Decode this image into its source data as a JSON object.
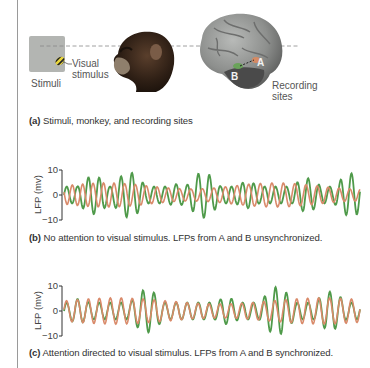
{
  "figure": {
    "panel_a": {
      "stimuli_label": "Stimuli",
      "visual_stimulus_label_line1": "Visual",
      "visual_stimulus_label_line2": "stimulus",
      "recording_sites_line1": "Recording",
      "recording_sites_line2": "sites",
      "site_a": "A",
      "site_b": "B",
      "caption_letter": "(a)",
      "caption_text": " Stimuli, monkey, and recording sites"
    },
    "panel_b": {
      "caption_letter": "(b)",
      "caption_text": " No attention to visual stimulus. LFPs from A and B unsynchronized."
    },
    "panel_c": {
      "caption_letter": "(c)",
      "caption_text": " Attention directed to visual stimulus. LFPs from A and B synchronized."
    },
    "axis": {
      "ylabel": "LFP (mv)",
      "ticks": [
        "10",
        "0",
        "−10"
      ]
    },
    "colors": {
      "site_a_trace": "#d98a6a",
      "site_b_trace": "#4f9a4a",
      "stimulus_gray": "#b3b5b2"
    }
  },
  "chart_data": [
    {
      "type": "line",
      "title": "(b) No attention to visual stimulus. LFPs from A and B unsynchronized.",
      "xlabel": "",
      "ylabel": "LFP (mv)",
      "ylim": [
        -10,
        10
      ],
      "yticks": [
        10,
        0,
        -10
      ],
      "grid": false,
      "series": [
        {
          "name": "Site B (green)",
          "color": "#4f9a4a",
          "description": "oscillation with bursts reaching about +10/-10 mV, out of phase with site A"
        },
        {
          "name": "Site A (orange)",
          "color": "#d98a6a",
          "description": "smaller oscillation about +/-4 mV, not phase locked to site B"
        }
      ]
    },
    {
      "type": "line",
      "title": "(c) Attention directed to visual stimulus. LFPs from A and B synchronized.",
      "xlabel": "",
      "ylabel": "LFP (mv)",
      "ylim": [
        -10,
        10
      ],
      "yticks": [
        10,
        0,
        -10
      ],
      "grid": false,
      "series": [
        {
          "name": "Site B (green)",
          "color": "#4f9a4a",
          "description": "oscillation with peaks up to about +10/-10 mV, in phase with site A"
        },
        {
          "name": "Site A (orange)",
          "color": "#d98a6a",
          "description": "smaller oscillation about +/-5 mV, phase locked to site B"
        }
      ]
    }
  ]
}
